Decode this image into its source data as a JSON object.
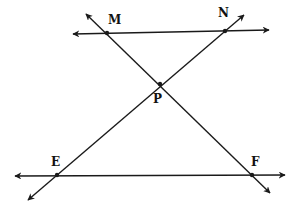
{
  "diagram": {
    "type": "geometry-intersecting-lines",
    "line_color": "#1a1a1a",
    "points": [
      {
        "name": "M",
        "label": "M"
      },
      {
        "name": "N",
        "label": "N"
      },
      {
        "name": "P",
        "label": "P"
      },
      {
        "name": "E",
        "label": "E"
      },
      {
        "name": "F",
        "label": "F"
      }
    ],
    "lines": [
      {
        "name": "line-MN",
        "through": [
          "M",
          "N"
        ],
        "description": "upper horizontal line"
      },
      {
        "name": "line-EF",
        "through": [
          "E",
          "F"
        ],
        "description": "lower horizontal line"
      },
      {
        "name": "line-MF",
        "through": [
          "M",
          "P",
          "F"
        ],
        "description": "transversal from upper-left to lower-right"
      },
      {
        "name": "line-NE",
        "through": [
          "N",
          "P",
          "E"
        ],
        "description": "transversal from upper-right to lower-left"
      }
    ]
  }
}
